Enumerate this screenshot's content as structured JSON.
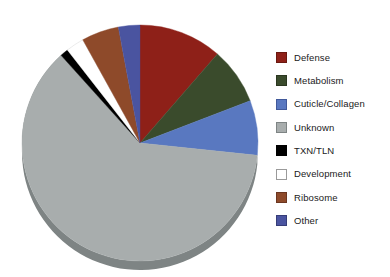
{
  "chart_data": {
    "type": "pie",
    "title": "",
    "subtitle": "",
    "xlabel": "",
    "ylabel": "",
    "grid": false,
    "legend_position": "right",
    "start_angle_deg": 0,
    "direction": "clockwise",
    "categories": [
      "Defense",
      "Metabolism",
      "Cuticle/Collagen",
      "Unknown",
      "TXN/TLN",
      "Development",
      "Ribosome",
      "Other"
    ],
    "values": [
      11.4,
      7.8,
      7.5,
      61.7,
      1.1,
      2.5,
      5.1,
      2.9
    ],
    "value_unit": "percent",
    "colors": [
      "#8e2018",
      "#3a4b2c",
      "#5978c0",
      "#a8adad",
      "#000000",
      "#ffffff",
      "#8e4a2a",
      "#4a54a0"
    ],
    "slices": [
      {
        "label": "Defense",
        "value": 11.4,
        "color": "#8e2018",
        "start_deg": 0.0,
        "end_deg": 41.0
      },
      {
        "label": "Metabolism",
        "value": 7.8,
        "color": "#3a4b2c",
        "start_deg": 41.0,
        "end_deg": 69.0
      },
      {
        "label": "Cuticle/Collagen",
        "value": 7.5,
        "color": "#5978c0",
        "start_deg": 69.0,
        "end_deg": 96.0
      },
      {
        "label": "Unknown",
        "value": 61.7,
        "color": "#a8adad",
        "start_deg": 96.0,
        "end_deg": 318.0
      },
      {
        "label": "TXN/TLN",
        "value": 1.1,
        "color": "#000000",
        "start_deg": 318.0,
        "end_deg": 322.0
      },
      {
        "label": "Development",
        "value": 2.5,
        "color": "#ffffff",
        "start_deg": 322.0,
        "end_deg": 331.0
      },
      {
        "label": "Ribosome",
        "value": 5.1,
        "color": "#8e4a2a",
        "start_deg": 331.0,
        "end_deg": 349.4
      },
      {
        "label": "Other",
        "value": 2.9,
        "color": "#4a54a0",
        "start_deg": 349.4,
        "end_deg": 360.0
      }
    ]
  },
  "legend": {
    "items": [
      {
        "label": "Defense",
        "color": "#8e2018",
        "border": "#6a1810"
      },
      {
        "label": "Metabolism",
        "color": "#3a4b2c",
        "border": "#2b3720"
      },
      {
        "label": "Cuticle/Collagen",
        "color": "#5978c0",
        "border": "#41599a"
      },
      {
        "label": "Unknown",
        "color": "#a8adad",
        "border": "#7e8484"
      },
      {
        "label": "TXN/TLN",
        "color": "#000000",
        "border": "#000000"
      },
      {
        "label": "Development",
        "color": "#ffffff",
        "border": "#9a9a9a"
      },
      {
        "label": "Ribosome",
        "color": "#8e4a2a",
        "border": "#6b3620"
      },
      {
        "label": "Other",
        "color": "#4a54a0",
        "border": "#363d78"
      }
    ]
  },
  "pie_geometry": {
    "center_x": 140,
    "center_y": 143,
    "radius": 118,
    "depth": 9,
    "rim_color": "#7e8484"
  }
}
